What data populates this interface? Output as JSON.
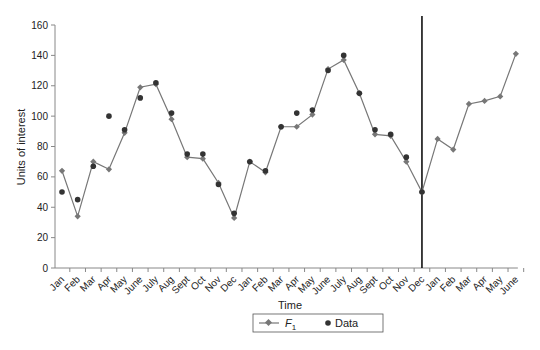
{
  "chart_data": {
    "type": "line",
    "title": "",
    "xlabel": "Time",
    "ylabel": "Units of interest",
    "ylim": [
      0,
      160
    ],
    "yticks": [
      0,
      20,
      40,
      60,
      80,
      100,
      120,
      140,
      160
    ],
    "grid": false,
    "legend_position": "bottom-center",
    "categories": [
      "Jan",
      "Feb",
      "Mar",
      "Apr",
      "May",
      "June",
      "July",
      "Aug",
      "Sept",
      "Oct",
      "Nov",
      "Dec",
      "Jan",
      "Feb",
      "Mar",
      "Apr",
      "May",
      "June",
      "July",
      "Aug",
      "Sept",
      "Oct",
      "Nov",
      "Dec",
      "Jan",
      "Feb",
      "Mar",
      "Apr",
      "May",
      "June"
    ],
    "series": [
      {
        "name": "F1",
        "style": "line-diamond",
        "color": "#777777",
        "values": [
          64,
          34,
          70,
          65,
          89,
          119,
          121,
          98,
          73,
          72,
          56,
          33,
          70,
          63,
          93,
          93,
          101,
          131,
          137,
          115,
          88,
          87,
          70,
          50,
          85,
          78,
          108,
          110,
          113,
          141
        ]
      },
      {
        "name": "Data",
        "style": "dot",
        "color": "#333333",
        "values": [
          50,
          45,
          67,
          100,
          91,
          112,
          122,
          102,
          75,
          75,
          55,
          36,
          70,
          64,
          93,
          102,
          104,
          130,
          140,
          115,
          91,
          88,
          73,
          50,
          null,
          null,
          null,
          null,
          null,
          null
        ]
      }
    ],
    "annotations": [
      {
        "type": "vertical-line",
        "at_index": 23,
        "label": ""
      }
    ]
  },
  "legend": {
    "f_label": "F",
    "f_subscript": "1",
    "data_label": "Data"
  },
  "axis": {
    "xlabel": "Time",
    "ylabel": "Units of interest"
  }
}
